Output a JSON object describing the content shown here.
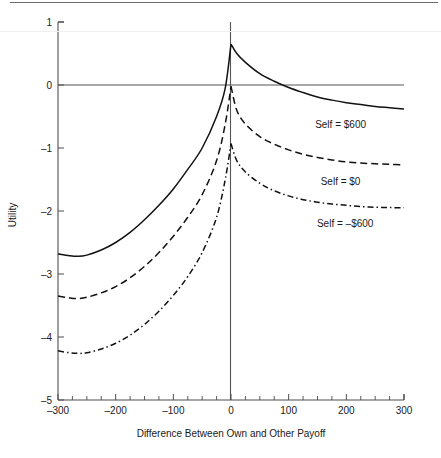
{
  "figure": {
    "background_color": "#ffffff",
    "ink_color": "#121212",
    "axis_color": "#4d4d4d",
    "has_top_scan_artifact": true
  },
  "chart_data": {
    "type": "line",
    "title": "",
    "subtitle": "",
    "xlabel": "Difference Between Own and Other Payoff",
    "ylabel": "Utility",
    "xlim": [
      -300,
      300
    ],
    "ylim": [
      -5,
      1
    ],
    "grid": false,
    "legend_position": "inline-right",
    "x_ticks": [
      -300,
      -200,
      -100,
      0,
      100,
      200,
      300
    ],
    "x_tick_labels": [
      "-300",
      "-200",
      "-100",
      "0",
      "100",
      "200",
      "300"
    ],
    "x_minor_tick_step": 25,
    "y_ticks": [
      1,
      0,
      -1,
      -2,
      -3,
      -4,
      -5
    ],
    "y_tick_labels": [
      "1",
      "0",
      "-1",
      "-2",
      "-3",
      "-4",
      "-5"
    ],
    "reference_lines": [
      {
        "name": "y-zero-line",
        "orientation": "horizontal",
        "value": 0
      },
      {
        "name": "x-zero-line",
        "orientation": "vertical",
        "value": 0
      }
    ],
    "x": [
      -300,
      -280,
      -265,
      -250,
      -225,
      -200,
      -175,
      -150,
      -125,
      -100,
      -75,
      -50,
      -25,
      -10,
      0,
      10,
      25,
      50,
      75,
      100,
      125,
      150,
      175,
      200,
      225,
      250,
      275,
      300
    ],
    "series": [
      {
        "name": "Self = $600",
        "label": "Self = $600",
        "style": "solid",
        "peak_x": 0,
        "peak_y": 0.65,
        "left_end_y": -2.68,
        "right_end_y": -0.38,
        "minimum": {
          "x": -265,
          "y": -2.72
        },
        "values": [
          -2.68,
          -2.71,
          -2.72,
          -2.7,
          -2.62,
          -2.5,
          -2.34,
          -2.14,
          -1.91,
          -1.65,
          -1.34,
          -1.0,
          -0.5,
          -0.05,
          0.65,
          0.5,
          0.36,
          0.18,
          0.06,
          -0.04,
          -0.12,
          -0.19,
          -0.24,
          -0.28,
          -0.31,
          -0.34,
          -0.36,
          -0.38
        ]
      },
      {
        "name": "Self = $0",
        "label": "Self = $0",
        "style": "dashed",
        "peak_x": 0,
        "peak_y": -0.02,
        "left_end_y": -3.35,
        "right_end_y": -1.27,
        "minimum": {
          "x": -268,
          "y": -3.39
        },
        "values": [
          -3.35,
          -3.38,
          -3.39,
          -3.37,
          -3.3,
          -3.2,
          -3.06,
          -2.88,
          -2.66,
          -2.4,
          -2.1,
          -1.74,
          -1.2,
          -0.62,
          -0.02,
          -0.4,
          -0.62,
          -0.82,
          -0.94,
          -1.03,
          -1.1,
          -1.15,
          -1.19,
          -1.22,
          -1.24,
          -1.25,
          -1.26,
          -1.27
        ]
      },
      {
        "name": "Self = -$600",
        "label": "Self = -$600",
        "style": "dashdot",
        "peak_x": 0,
        "peak_y": -0.93,
        "left_end_y": -4.22,
        "right_end_y": -1.95,
        "minimum": {
          "x": -270,
          "y": -4.26
        },
        "values": [
          -4.22,
          -4.25,
          -4.26,
          -4.25,
          -4.19,
          -4.1,
          -3.97,
          -3.8,
          -3.59,
          -3.34,
          -3.04,
          -2.66,
          -2.1,
          -1.5,
          -0.93,
          -1.2,
          -1.38,
          -1.56,
          -1.68,
          -1.76,
          -1.82,
          -1.86,
          -1.89,
          -1.91,
          -1.93,
          -1.94,
          -1.945,
          -1.95
        ]
      }
    ],
    "annotations": [
      {
        "name": "series-label-self-600",
        "text": "Self = $600",
        "x": 190,
        "y": -0.68
      },
      {
        "name": "series-label-self-0",
        "text": "Self = $0",
        "x": 190,
        "y": -1.58
      },
      {
        "name": "series-label-self-neg600",
        "text": "Self = -$600",
        "x": 198,
        "y": -2.26
      }
    ]
  }
}
